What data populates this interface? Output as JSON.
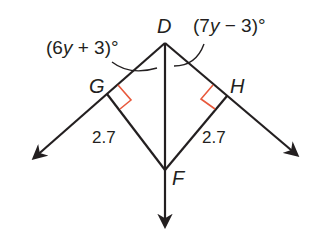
{
  "diagram": {
    "type": "geometry",
    "points": {
      "D": {
        "label": "D",
        "x": 165,
        "y": 43
      },
      "G": {
        "label": "G",
        "x": 107,
        "y": 94
      },
      "H": {
        "label": "H",
        "x": 227,
        "y": 96
      },
      "F": {
        "label": "F",
        "x": 165,
        "y": 170
      }
    },
    "angles": {
      "left": {
        "expr_pre": "(6",
        "var": "y",
        "expr_post": " + 3)°"
      },
      "right": {
        "expr_pre": "(7",
        "var": "y",
        "expr_post": " − 3)°"
      }
    },
    "lengths": {
      "GF": "2.7",
      "HF": "2.7"
    },
    "colors": {
      "line": "#231f20",
      "right_angle_marker": "#e8593c"
    }
  }
}
